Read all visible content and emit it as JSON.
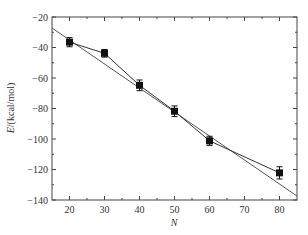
{
  "chart_data": {
    "type": "scatter",
    "title": "",
    "xlabel": "N",
    "ylabel": "E/(kcal/mol)",
    "xlim": [
      15,
      85
    ],
    "ylim": [
      -140,
      -20
    ],
    "xticks": [
      20,
      30,
      40,
      50,
      60,
      70,
      80
    ],
    "xminor": [
      25,
      35,
      45,
      55,
      65,
      75
    ],
    "yticks": [
      -20,
      -40,
      -60,
      -80,
      -100,
      -120,
      -140
    ],
    "yminor": [
      -30,
      -50,
      -70,
      -90,
      -110,
      -130
    ],
    "grid": false,
    "legend": null,
    "series": [
      {
        "name": "data",
        "style": "square markers with error bars, connected by line",
        "x": [
          20,
          30,
          40,
          50,
          60,
          80
        ],
        "y": [
          -36.5,
          -43.8,
          -64.8,
          -81.8,
          -101.2,
          -122.2
        ],
        "yerr": [
          3,
          2.5,
          3.5,
          3.5,
          3,
          4
        ]
      },
      {
        "name": "linear fit",
        "style": "straight line",
        "x": [
          15,
          85
        ],
        "y": [
          -27.2,
          -137.4
        ]
      }
    ]
  }
}
